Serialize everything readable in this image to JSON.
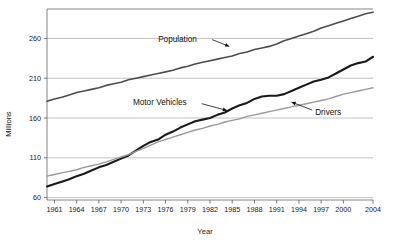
{
  "chart_data": {
    "type": "line",
    "title": "",
    "xlabel": "Year",
    "ylabel": "Millions",
    "xlim": [
      1960,
      2004
    ],
    "ylim": [
      57,
      297
    ],
    "grid": true,
    "legend_position": "inline-annotations",
    "xticks": [
      "1961",
      "1964",
      "1967",
      "1970",
      "1973",
      "1976",
      "1979",
      "1982",
      "1985",
      "1988",
      "1991",
      "1994",
      "1997",
      "2000",
      "2004"
    ],
    "yticks": [
      "60",
      "110",
      "160",
      "210",
      "260"
    ],
    "x": [
      1960,
      1961,
      1962,
      1963,
      1964,
      1965,
      1966,
      1967,
      1968,
      1969,
      1970,
      1971,
      1972,
      1973,
      1974,
      1975,
      1976,
      1977,
      1978,
      1979,
      1980,
      1981,
      1982,
      1983,
      1984,
      1985,
      1986,
      1987,
      1988,
      1989,
      1990,
      1991,
      1992,
      1993,
      1994,
      1995,
      1996,
      1997,
      1998,
      1999,
      2000,
      2001,
      2002,
      2003,
      2004
    ],
    "series": [
      {
        "name": "Population",
        "color": "#4d4d4d",
        "width": 1.6,
        "values": [
          181,
          184,
          186,
          189,
          192,
          194,
          196,
          198,
          201,
          203,
          205,
          208,
          210,
          212,
          214,
          216,
          218,
          220,
          223,
          225,
          228,
          230,
          232,
          234,
          236,
          238,
          241,
          243,
          246,
          248,
          250,
          253,
          257,
          260,
          263,
          266,
          269,
          273,
          276,
          279,
          282,
          285,
          288,
          291,
          293
        ]
      },
      {
        "name": "Motor Vehicles",
        "color": "#1a1a1a",
        "width": 2.1,
        "values": [
          74,
          77,
          80,
          83,
          87,
          90,
          94,
          98,
          101,
          105,
          109,
          113,
          119,
          125,
          130,
          133,
          139,
          143,
          148,
          152,
          156,
          158,
          160,
          164,
          167,
          172,
          176,
          179,
          184,
          187,
          188,
          188,
          190,
          194,
          198,
          202,
          206,
          208,
          211,
          216,
          221,
          226,
          229,
          231,
          237
        ]
      },
      {
        "name": "Drivers",
        "color": "#9a9a9a",
        "width": 1.4,
        "values": [
          87,
          89,
          91,
          93,
          95,
          98,
          100,
          102,
          105,
          108,
          111,
          114,
          118,
          122,
          126,
          130,
          133,
          136,
          139,
          142,
          145,
          147,
          150,
          152,
          155,
          157,
          159,
          162,
          164,
          166,
          168,
          170,
          172,
          174,
          176,
          178,
          180,
          182,
          184,
          187,
          190,
          192,
          194,
          196,
          198
        ]
      }
    ],
    "annotations": [
      {
        "text": "Population",
        "label_x": 1975.0,
        "label_y": 259.0,
        "arrow_from_x": 1982.3,
        "arrow_from_y": 258.5,
        "arrow_to_x": 1984.6,
        "arrow_to_y": 250.0
      },
      {
        "text": "Motor Vehicles",
        "label_x": 1971.6,
        "label_y": 180.0,
        "arrow_from_x": 1980.9,
        "arrow_from_y": 178.0,
        "arrow_to_x": 1984.3,
        "arrow_to_y": 169.5
      },
      {
        "text": "Drivers",
        "label_x": 1996.2,
        "label_y": 168.0,
        "arrow_from_x": 1995.8,
        "arrow_from_y": 170.0,
        "arrow_to_x": 1993.0,
        "arrow_to_y": 180.0
      }
    ]
  }
}
